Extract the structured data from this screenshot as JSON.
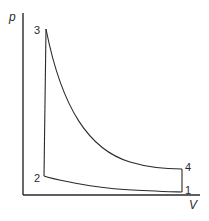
{
  "diagram": {
    "type": "p-V cycle diagram",
    "axes": {
      "y_label": "p",
      "x_label": "V"
    },
    "points": [
      {
        "id": "1",
        "label": "1"
      },
      {
        "id": "2",
        "label": "2"
      },
      {
        "id": "3",
        "label": "3"
      },
      {
        "id": "4",
        "label": "4"
      }
    ],
    "processes": [
      {
        "from": "1",
        "to": "2",
        "shape": "curve"
      },
      {
        "from": "2",
        "to": "3",
        "shape": "vertical line"
      },
      {
        "from": "3",
        "to": "4",
        "shape": "curve"
      },
      {
        "from": "4",
        "to": "1",
        "shape": "vertical line"
      }
    ],
    "line_color": "#2a2a2a"
  }
}
